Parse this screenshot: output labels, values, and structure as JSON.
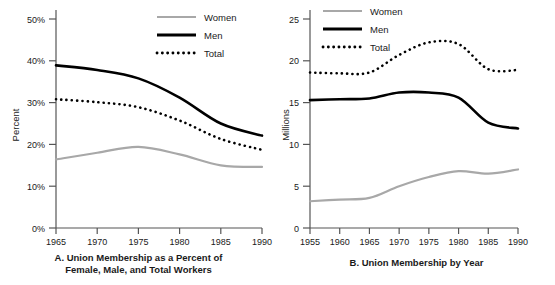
{
  "figure": {
    "panels": [
      {
        "id": "A",
        "caption_line1": "A. Union Membership as a Percent of",
        "caption_line2": "Female, Male, and Total Workers",
        "chart_data": {
          "type": "line",
          "title": "A. Union Membership as a Percent of Female, Male, and Total Workers",
          "xlabel": "",
          "ylabel": "Percent",
          "xlim": [
            1965,
            1990
          ],
          "ylim": [
            0,
            50
          ],
          "xticks": [
            "1965",
            "1970",
            "1975",
            "1980",
            "1985",
            "1990"
          ],
          "yticks": [
            "0%",
            "10%",
            "20%",
            "30%",
            "40%",
            "50%"
          ],
          "grid": false,
          "legend_position": "top-right",
          "x": [
            1965,
            1970,
            1975,
            1980,
            1985,
            1990
          ],
          "series": [
            {
              "name": "Women",
              "color": "#a8a8a8",
              "style": "solid-thin",
              "values": [
                16.4,
                18.0,
                19.4,
                17.6,
                15.0,
                14.6
              ]
            },
            {
              "name": "Men",
              "color": "#000000",
              "style": "solid-thick",
              "values": [
                38.9,
                37.8,
                35.8,
                31.2,
                25.0,
                22.1
              ]
            },
            {
              "name": "Total",
              "color": "#000000",
              "style": "dotted",
              "values": [
                30.8,
                30.1,
                28.9,
                25.7,
                21.3,
                18.7
              ]
            }
          ]
        }
      },
      {
        "id": "B",
        "caption_line1": "B. Union Membership by Year",
        "caption_line2": "",
        "chart_data": {
          "type": "line",
          "title": "B. Union Membership by Year",
          "xlabel": "",
          "ylabel": "Millions",
          "xlim": [
            1955,
            1990
          ],
          "ylim": [
            0,
            25
          ],
          "xticks": [
            "1955",
            "1960",
            "1965",
            "1970",
            "1975",
            "1980",
            "1985",
            "1990"
          ],
          "yticks": [
            "0",
            "5",
            "10",
            "15",
            "20",
            "25"
          ],
          "grid": false,
          "legend_position": "top-left",
          "x": [
            1955,
            1960,
            1965,
            1970,
            1975,
            1980,
            1985,
            1990
          ],
          "series": [
            {
              "name": "Women",
              "color": "#a8a8a8",
              "style": "solid-thin",
              "values": [
                3.2,
                3.4,
                3.6,
                5.0,
                6.1,
                6.8,
                6.5,
                7.0
              ]
            },
            {
              "name": "Men",
              "color": "#000000",
              "style": "solid-thick",
              "values": [
                15.3,
                15.4,
                15.5,
                16.2,
                16.2,
                15.6,
                12.6,
                11.9
              ]
            },
            {
              "name": "Total",
              "color": "#000000",
              "style": "dotted",
              "values": [
                18.6,
                18.5,
                18.6,
                20.7,
                22.2,
                22.0,
                19.0,
                18.9
              ]
            }
          ]
        }
      }
    ],
    "legend": {
      "items": [
        {
          "label": "Women",
          "swatch": "legend-swatch-women"
        },
        {
          "label": "Men",
          "swatch": "legend-swatch-men"
        },
        {
          "label": "Total",
          "swatch": "legend-swatch-total"
        }
      ]
    },
    "colors": {
      "women": "#a8a8a8",
      "men": "#000000",
      "total": "#000000",
      "axis": "#555555",
      "background": "#ffffff"
    }
  }
}
